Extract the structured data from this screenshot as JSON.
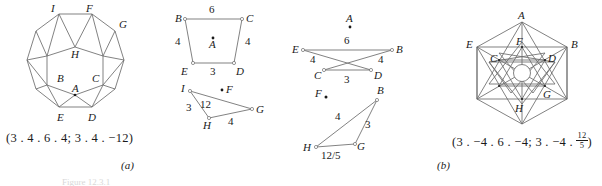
{
  "figure": {
    "panels": [
      {
        "id": "a",
        "panel_label": "(a)",
        "caption": "(3 . 4 . 6 . 4; 3 . 4 . −12)",
        "diagrams": [
          {
            "name": "rhombitrihexagonal-vertex-figure",
            "vertex_labels": [
              "I",
              "F",
              "G",
              "H",
              "B",
              "C",
              "A",
              "E",
              "D"
            ]
          },
          {
            "name": "trapezoid-BCDE",
            "vertex_labels": [
              "B",
              "C",
              "E",
              "D",
              "A"
            ],
            "edge_labels": [
              "6",
              "4",
              "4",
              "3"
            ]
          },
          {
            "name": "triangle-IHG",
            "vertex_labels": [
              "I",
              "F",
              "G",
              "H"
            ],
            "edge_labels": [
              "3",
              "12",
              "4"
            ]
          }
        ]
      },
      {
        "id": "b",
        "panel_label": "(b)",
        "caption_prefix": "(3 . −4 . 6 . −4; 3 . −4 . ",
        "caption_fraction_numerator": "12",
        "caption_fraction_denominator": "5",
        "caption_suffix": ")",
        "diagrams": [
          {
            "name": "crossed-quadrilateral-EBCD",
            "vertex_labels": [
              "A",
              "E",
              "B",
              "C",
              "D"
            ],
            "edge_labels": [
              "6",
              "4",
              "4",
              "3"
            ]
          },
          {
            "name": "crossed-triangle-BHG",
            "vertex_labels": [
              "F",
              "B",
              "H",
              "G"
            ],
            "edge_labels": [
              "4",
              "3",
              "12/5"
            ]
          },
          {
            "name": "star-polygon-vertex-figure",
            "vertex_labels": [
              "A",
              "E",
              "F",
              "B",
              "C",
              "D",
              "G",
              "H"
            ]
          }
        ]
      }
    ],
    "footer_caption": "Figure 12.3.1"
  },
  "colors": {
    "ink": "#1a1a1a",
    "line": "#6b6b6b",
    "background": "#ffffff"
  }
}
